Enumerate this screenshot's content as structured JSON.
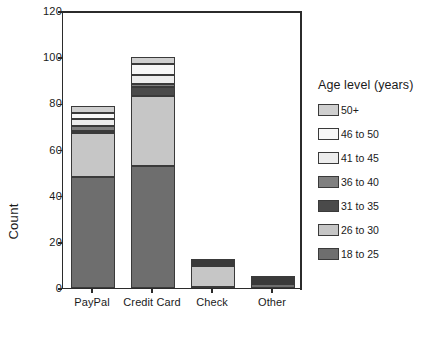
{
  "chart_data": {
    "type": "bar",
    "subtype": "stacked-bar",
    "title": "",
    "xlabel": "",
    "ylabel": "Count",
    "ylim": [
      0,
      120
    ],
    "yticks": [
      0,
      20,
      40,
      60,
      80,
      100,
      120
    ],
    "grid": false,
    "legend_position": "right",
    "legend_title": "Age level (years)",
    "categories": [
      "PayPal",
      "Credit Card",
      "Check",
      "Other"
    ],
    "series": [
      {
        "name": "18 to 25",
        "color": "#6e6e6e",
        "values": [
          48,
          53,
          0.6,
          1.8
        ]
      },
      {
        "name": "26 to 30",
        "color": "#c6c6c6",
        "values": [
          19,
          30,
          9.0,
          0.6
        ]
      },
      {
        "name": "31 to 35",
        "color": "#4a4a4a",
        "values": [
          1.2,
          4.0,
          0.5,
          0.5
        ]
      },
      {
        "name": "36 to 40",
        "color": "#808080",
        "values": [
          2.2,
          1.2,
          0.4,
          0.4
        ]
      },
      {
        "name": "41 to 45",
        "color": "#ededed",
        "values": [
          3.0,
          4.0,
          0.7,
          0.7
        ]
      },
      {
        "name": "46 to 50",
        "color": "#f7f7f7",
        "values": [
          2.6,
          4.8,
          0.4,
          0.3
        ]
      },
      {
        "name": "50+",
        "color": "#cfcfcf",
        "values": [
          3.0,
          3.0,
          0.4,
          0.2
        ]
      }
    ],
    "totals": [
      79,
      100,
      12,
      4.5
    ]
  },
  "axes": {
    "y_title": "Count",
    "y_tick_labels": [
      "0",
      "20",
      "40",
      "60",
      "80",
      "100",
      "120"
    ],
    "x_tick_labels": [
      "PayPal",
      "Credit Card",
      "Check",
      "Other"
    ]
  },
  "legend": {
    "title": "Age level (years)",
    "entries": [
      {
        "label": "50+",
        "color": "#cfcfcf"
      },
      {
        "label": "46 to 50",
        "color": "#f7f7f7"
      },
      {
        "label": "41 to 45",
        "color": "#ededed"
      },
      {
        "label": "36 to 40",
        "color": "#808080"
      },
      {
        "label": "31 to 35",
        "color": "#4a4a4a"
      },
      {
        "label": "26 to 30",
        "color": "#c6c6c6"
      },
      {
        "label": "18 to 25",
        "color": "#6e6e6e"
      }
    ]
  },
  "style": {
    "axis_color": "#2b2b2b",
    "background": "#ffffff",
    "bar_edge": "#3a3a3a"
  }
}
